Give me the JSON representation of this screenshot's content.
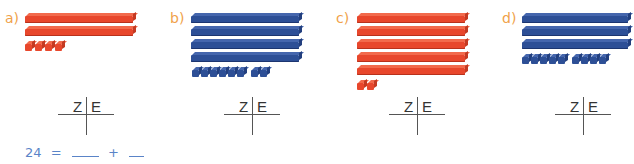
{
  "colors": {
    "label": "#f0a24a",
    "red_block": "#e8472c",
    "blue_block": "#2d4f96",
    "table_line": "#555555",
    "handwriting": "#5a84c8"
  },
  "exercises": [
    {
      "label": "a)",
      "color": "red",
      "tens": 2,
      "ones": 4,
      "table": {
        "z": "Z",
        "e": "E"
      }
    },
    {
      "label": "b)",
      "color": "blue",
      "tens": 4,
      "ones": 8,
      "table": {
        "z": "Z",
        "e": "E"
      }
    },
    {
      "label": "c)",
      "color": "red",
      "tens": 5,
      "ones": 2,
      "table": {
        "z": "Z",
        "e": "E"
      }
    },
    {
      "label": "d)",
      "color": "blue",
      "tens": 3,
      "ones": 9,
      "table": {
        "z": "Z",
        "e": "E"
      }
    }
  ],
  "equation": {
    "left": "24",
    "equals": "=",
    "plus": "+"
  }
}
